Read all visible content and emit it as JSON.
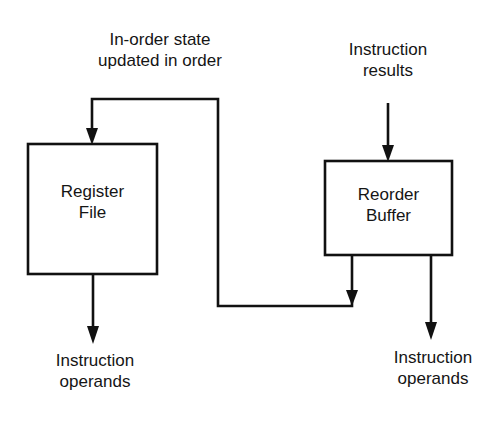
{
  "diagram": {
    "type": "block-diagram",
    "colors": {
      "background": "#ffffff",
      "stroke": "#111111",
      "text": "#151515"
    },
    "top_left_label": {
      "line1": "In-order state",
      "line2": "updated in order"
    },
    "top_right_label": {
      "line1": "Instruction",
      "line2": "results"
    },
    "register_file": {
      "line1": "Register",
      "line2": "File"
    },
    "reorder_buffer": {
      "line1": "Reorder",
      "line2": "Buffer"
    },
    "bottom_left_label": {
      "line1": "Instruction",
      "line2": "operands"
    },
    "bottom_right_label": {
      "line1": "Instruction",
      "line2": "operands"
    },
    "connections": [
      {
        "from": "reorder_buffer",
        "to": "register_file",
        "description": "In-order state updated in order (feedback path)"
      },
      {
        "from": "instruction_results",
        "to": "reorder_buffer"
      },
      {
        "from": "register_file",
        "to": "instruction_operands_left"
      },
      {
        "from": "reorder_buffer",
        "to": "instruction_operands_right"
      }
    ]
  }
}
